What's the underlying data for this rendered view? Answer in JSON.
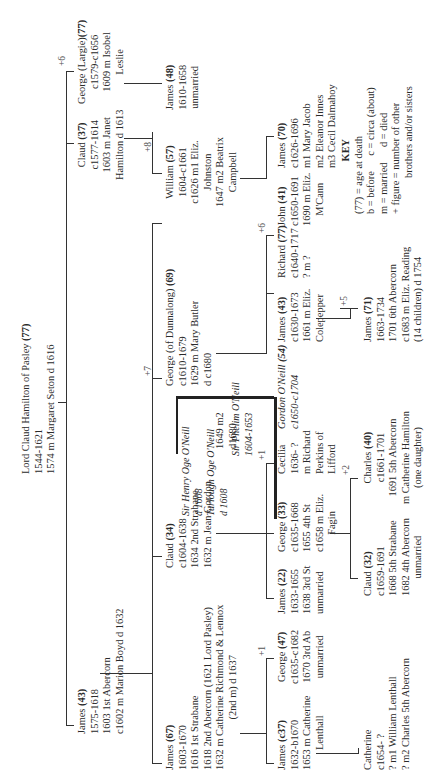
{
  "root": {
    "name": "Lord Claud Hamilton of Pasley",
    "age": "(77)",
    "dates": "1544-1621",
    "marriage": "1574 m Margaret Seton d 1616",
    "siblings_note": "+6"
  },
  "gen1": [
    {
      "name": "James",
      "age": "(43)",
      "lines": [
        "1575-1618",
        "1603 1st Abercorn",
        "c1602 m Marion Boyd d 1632"
      ],
      "underline": "Abercorn"
    },
    {
      "name": "Claud",
      "age": "(37)",
      "lines": [
        "c1577-1614",
        "1603 m Janet",
        "Hamilton d 1613"
      ]
    },
    {
      "name": "George (Largie)",
      "age": "(77)",
      "lines": [
        "c1579-c1656",
        "1609 m Isobel",
        "Leslie"
      ]
    }
  ],
  "gen2_james": [
    {
      "name": "James",
      "age": "(67)",
      "lines": [
        "1603-1670",
        "1616 1st Strabane",
        "1618 2nd Abercorn  (1621 Lord Pasley)",
        "1632 m Catherine Richmond & Lennox",
        "(2nd m) d 1637"
      ]
    },
    {
      "name": "Claud",
      "age": "(34)",
      "lines": [
        "c1604-1638",
        "1634 2nd Strabane",
        "1632 m Jean Gordon",
        "1649 m2 Sir Phelim O'Neill",
        "d1680"
      ]
    },
    {
      "name": "George (of Dunnalong)",
      "age": "(69)",
      "lines": [
        "c1610-1679",
        "1629 m Mary Butler",
        "d c1680"
      ],
      "siblings_note": "+7"
    },
    {
      "name": "William",
      "age": "(57)",
      "lines": [
        "1604-c1661",
        "c1626 m1 Eliz.",
        "Johnston",
        "1647 m2 Beatrix",
        "Campbell"
      ],
      "siblings_note": "+8"
    },
    {
      "name": "James",
      "age": "(48)",
      "lines": [
        "1610-1658",
        "unmarried"
      ]
    }
  ],
  "oneill_box": [
    {
      "name": "Sir Henry Oge O'Neill",
      "lines": [
        "d 1608"
      ]
    },
    {
      "name": "Turlough Oge O'Neill",
      "lines": [
        "d 1608"
      ]
    },
    {
      "name": "Sir Phelim O'Neill",
      "lines": [
        "1604-1653"
      ]
    }
  ],
  "gen3": [
    {
      "name": "James",
      "age": "(c37)",
      "lines": [
        "1632-b1670",
        "1653 m Catherine",
        "Lenthall"
      ]
    },
    {
      "name": "George",
      "age": "(47)",
      "lines": [
        "c1635-c1682",
        "1670 3rd Ab",
        "unmarried"
      ],
      "siblings_note": "+1"
    },
    {
      "name": "James",
      "age": "(22)",
      "lines": [
        "1633-1655",
        "1638 3rd St",
        "unmarried"
      ]
    },
    {
      "name": "George",
      "age": "(33)",
      "lines": [
        "c1635-1668",
        "1655  4th St",
        "c1658 m Eliz.",
        "Fagin"
      ]
    },
    {
      "name": "Cecilia",
      "age": "",
      "lines": [
        "1636- ?",
        "m Richard",
        "Perkins of",
        "Lifford"
      ],
      "siblings_note": "+1"
    },
    {
      "name": "Gordon O'Neill",
      "age": "(54)",
      "lines": [
        "c1650-c1704"
      ],
      "italic": true
    },
    {
      "name": "James",
      "age": "(43)",
      "lines": [
        "c1630-1673",
        "1661 m Eliz.",
        "Colepepper"
      ]
    },
    {
      "name": "Richard",
      "age": "(77)",
      "lines": [
        "c1640-1717",
        "? m ?"
      ]
    },
    {
      "name": "John",
      "age": "(41)",
      "lines": [
        "c1650-1691",
        "1690 m Eliz.",
        "M'Cann"
      ],
      "siblings_note": "+6"
    },
    {
      "name": "James",
      "age": "(70)",
      "lines": [
        "c1626-1696",
        "m1 Mary Jacob",
        "m2 Eleanor Innes",
        "m3 Cecil Dalmahoy"
      ]
    }
  ],
  "gen4": [
    {
      "name": "Catherine",
      "age": "",
      "lines": [
        "c1654- ?",
        "? m1 William Lenthall",
        "? m2 Charles 5th Abercorn"
      ]
    },
    {
      "name": "Claud",
      "age": "(32)",
      "lines": [
        "c1659-1691",
        "1668 5th Strabane",
        "1682 4th Abercorn",
        "unmarried"
      ]
    },
    {
      "name": "Charles",
      "age": "(40)",
      "lines": [
        "c1661-1701",
        "1691 5th Abercorn",
        "m Catherine Hamilton",
        "(one daughter)"
      ],
      "siblings_note": "+2"
    },
    {
      "name": "James",
      "age": "(71)",
      "lines": [
        "1663-1734",
        "1701 6th Abercorn",
        "c1683 m Eliz. Reading",
        "(14 children) d 1754"
      ],
      "siblings_note": "+5"
    }
  ],
  "key": {
    "title": "KEY",
    "lines": [
      "(77) = age at death",
      "b = before      c = circa (about)",
      "m = married      d = died",
      "+ figure = number of other",
      "brothers and/or sisters"
    ]
  }
}
